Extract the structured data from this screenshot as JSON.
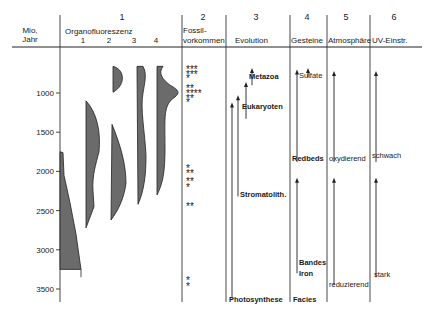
{
  "chart_data": {
    "type": "diagram",
    "title": "",
    "y_axis": {
      "label_line1": "Mio,",
      "label_line2": "Jahr",
      "ticks": [
        1000,
        1500,
        2000,
        2500,
        3000,
        3500
      ],
      "range": [
        600,
        3800
      ],
      "inverted": true
    },
    "columns": [
      {
        "number": "1",
        "title": "Organofluoreszenz",
        "subcolumns": [
          "1",
          "2",
          "3",
          "4"
        ]
      },
      {
        "number": "2",
        "title_line1": "Fossil-",
        "title_line2": "vorkommen"
      },
      {
        "number": "3",
        "title": "Evolution"
      },
      {
        "number": "4",
        "title": "Gesteine"
      },
      {
        "number": "5",
        "title": "Atmosphäre"
      },
      {
        "number": "6",
        "title": "UV-Einstr."
      }
    ],
    "organofluoreszenz": [
      {
        "series": "1",
        "points": [
          [
            0,
            1750
          ],
          [
            0.12,
            1800
          ],
          [
            0.3,
            2300
          ],
          [
            0.55,
            2900
          ],
          [
            0.8,
            3250
          ],
          [
            0,
            3250
          ]
        ],
        "range_myr": [
          1750,
          3250
        ],
        "tail_end": 3350
      },
      {
        "series": "2",
        "range_myr": [
          1100,
          2750
        ]
      },
      {
        "series": "3",
        "range_myr": [
          700,
          2600
        ],
        "gap_myr": [
          1000,
          1400
        ]
      },
      {
        "series": "4",
        "range_myr": [
          700,
          2450
        ]
      },
      {
        "series": "4b",
        "range_myr": [
          700,
          2300
        ]
      }
    ],
    "fossil_occurrences": [
      {
        "myr": 700,
        "count": 3
      },
      {
        "myr": 760,
        "count": 3
      },
      {
        "myr": 810,
        "count": 1
      },
      {
        "myr": 930,
        "count": 2
      },
      {
        "myr": 1000,
        "count": 4
      },
      {
        "myr": 1060,
        "count": 2
      },
      {
        "myr": 1120,
        "count": 1
      },
      {
        "myr": 1960,
        "count": 1
      },
      {
        "myr": 2020,
        "count": 2
      },
      {
        "myr": 2120,
        "count": 2
      },
      {
        "myr": 2200,
        "count": 1
      },
      {
        "myr": 2440,
        "count": 2
      },
      {
        "myr": 3380,
        "count": 1
      },
      {
        "myr": 3460,
        "count": 1
      }
    ],
    "evolution": [
      {
        "label": "Metazoa",
        "arrow_from_myr": 900,
        "arrow_to_myr": 680
      },
      {
        "label": "Eukaryoten",
        "arrow_from_myr": 1330,
        "arrow_to_myr": 860
      },
      {
        "label": "Stromatolith.",
        "arrow_from_myr": 2320,
        "arrow_to_myr": 1030
      },
      {
        "label": "Photosynthese",
        "arrow_from_myr": 3620,
        "arrow_to_myr": 1120
      }
    ],
    "gesteine": [
      {
        "label": "Sulfate",
        "arrow_from_myr": 800,
        "arrow_to_myr": 680
      },
      {
        "label": "Redbeds",
        "arrow_from_myr": 1880,
        "arrow_to_myr": 700
      },
      {
        "label_line1": "Bandes",
        "label_line2": "Iron",
        "label_line3": "Facies",
        "arrow_from_myr": 3300,
        "arrow_to_myr": 2080
      }
    ],
    "atmosphaere": [
      {
        "label": "oxydierend",
        "arrow_from_myr": 1880,
        "arrow_to_myr": 720
      },
      {
        "label": "reduzierend",
        "arrow_from_myr": 3450,
        "arrow_to_myr": 2080
      }
    ],
    "uv": [
      {
        "label": "schwach",
        "arrow_from_myr": 1880,
        "arrow_to_myr": 720
      },
      {
        "label": "stark",
        "arrow_from_myr": 3350,
        "arrow_to_myr": 2080
      }
    ]
  }
}
